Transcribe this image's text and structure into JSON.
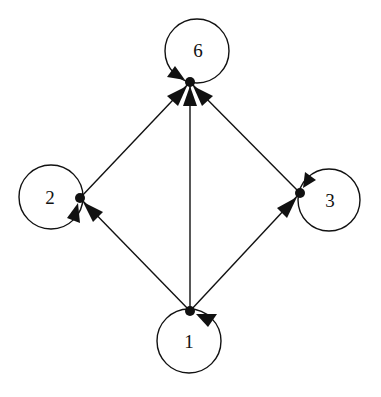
{
  "diagram": {
    "type": "directed-graph",
    "nodes": [
      {
        "id": "6",
        "label": "6",
        "loop_center": [
          197,
          51
        ],
        "anchor": [
          190,
          82
        ]
      },
      {
        "id": "2",
        "label": "2",
        "loop_center": [
          51,
          197
        ],
        "anchor": [
          80,
          198
        ]
      },
      {
        "id": "3",
        "label": "3",
        "loop_center": [
          329,
          200
        ],
        "anchor": [
          300,
          193
        ]
      },
      {
        "id": "1",
        "label": "1",
        "loop_center": [
          189,
          341
        ],
        "anchor": [
          190,
          311
        ]
      }
    ],
    "edges": [
      {
        "from": "1",
        "to": "2"
      },
      {
        "from": "1",
        "to": "6"
      },
      {
        "from": "1",
        "to": "3"
      },
      {
        "from": "2",
        "to": "6"
      },
      {
        "from": "3",
        "to": "6"
      }
    ],
    "self_loops": [
      "6",
      "2",
      "3",
      "1"
    ],
    "colors": {
      "stroke": "#111111",
      "background": "#ffffff"
    }
  }
}
